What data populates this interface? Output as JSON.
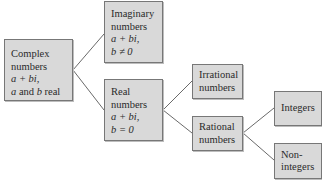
{
  "diagram": {
    "title": "",
    "type": "tree",
    "colors": {
      "box_fill": "#d9d9d9",
      "box_border": "#777777",
      "connector": "#6a6a6a",
      "text": "#2a2a2a"
    },
    "nodes": {
      "complex": {
        "line1": "Complex",
        "line2": "numbers",
        "line3": "a + bi,",
        "line4_a": "a",
        "line4_and": " and ",
        "line4_b": "b",
        "line4_real": " real"
      },
      "imaginary": {
        "line1": "Imaginary",
        "line2": "numbers",
        "line3": "a + bi,",
        "line4": "b ≠ 0"
      },
      "real": {
        "line1": "Real",
        "line2": "numbers",
        "line3": "a + bi,",
        "line4": "b = 0"
      },
      "irrational": {
        "line1": "Irrational",
        "line2": "numbers"
      },
      "rational": {
        "line1": "Rational",
        "line2": "numbers"
      },
      "integers": {
        "line1": "Integers"
      },
      "nonintegers": {
        "line1": "Non-",
        "line2": "integers"
      }
    },
    "edges": [
      {
        "from": "complex",
        "to": "imaginary"
      },
      {
        "from": "complex",
        "to": "real"
      },
      {
        "from": "real",
        "to": "irrational"
      },
      {
        "from": "real",
        "to": "rational"
      },
      {
        "from": "rational",
        "to": "integers"
      },
      {
        "from": "rational",
        "to": "nonintegers"
      }
    ]
  }
}
